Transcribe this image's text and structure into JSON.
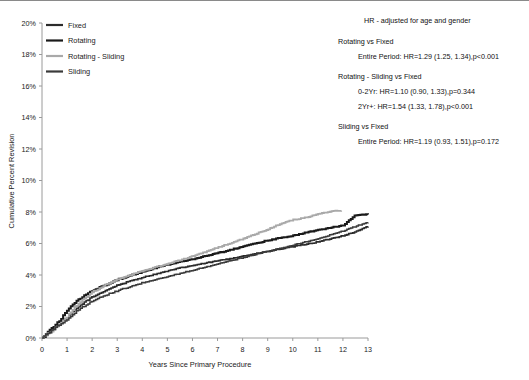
{
  "chart_data": {
    "type": "line",
    "title": "",
    "xlabel": "Years Since Primary Procedure",
    "ylabel": "Cumulative Percent Revision",
    "xlim": [
      0,
      13
    ],
    "ylim": [
      0,
      20
    ],
    "xticks": [
      "0",
      "1",
      "2",
      "3",
      "4",
      "5",
      "6",
      "7",
      "8",
      "9",
      "10",
      "11",
      "12",
      "13"
    ],
    "yticks": [
      "0%",
      "2%",
      "4%",
      "6%",
      "8%",
      "10%",
      "12%",
      "14%",
      "16%",
      "18%",
      "20%"
    ],
    "grid": false,
    "legend_position": "top-left",
    "x": [
      0,
      0.25,
      0.5,
      0.75,
      1,
      1.25,
      1.5,
      1.75,
      2,
      2.5,
      3,
      3.5,
      4,
      4.5,
      5,
      5.5,
      6,
      6.5,
      7,
      7.5,
      8,
      8.5,
      9,
      9.5,
      10,
      10.5,
      11,
      11.5,
      12,
      12.5,
      13
    ],
    "series": [
      {
        "name": "Fixed",
        "color": "#2b2b2b",
        "width": 1.6,
        "values": [
          0,
          0.35,
          0.65,
          0.95,
          1.3,
          1.7,
          2.05,
          2.35,
          2.6,
          3.0,
          3.35,
          3.6,
          3.85,
          4.05,
          4.25,
          4.45,
          4.6,
          4.75,
          4.9,
          5.05,
          5.2,
          5.35,
          5.5,
          5.65,
          5.8,
          5.95,
          6.1,
          6.3,
          6.5,
          6.75,
          7.1
        ]
      },
      {
        "name": "Rotating",
        "color": "#1a1a1a",
        "width": 2.0,
        "values": [
          0,
          0.4,
          0.8,
          1.2,
          1.75,
          2.2,
          2.5,
          2.75,
          3.0,
          3.35,
          3.7,
          3.95,
          4.2,
          4.45,
          4.65,
          4.85,
          5.0,
          5.2,
          5.4,
          5.6,
          5.8,
          6.0,
          6.2,
          6.35,
          6.5,
          6.7,
          6.85,
          7.0,
          7.15,
          7.8,
          7.85
        ]
      },
      {
        "name": "Rotating - Sliding",
        "color": "#a9a9a9",
        "width": 1.8,
        "values": [
          0,
          0.3,
          0.6,
          0.95,
          1.35,
          1.85,
          2.25,
          2.6,
          2.9,
          3.35,
          3.7,
          4.0,
          4.25,
          4.5,
          4.7,
          4.95,
          5.2,
          5.45,
          5.75,
          6.0,
          6.3,
          6.6,
          6.9,
          7.25,
          7.5,
          7.65,
          7.85,
          8.05,
          8.1,
          null,
          null
        ]
      },
      {
        "name": "Sliding",
        "color": "#3a3a3a",
        "width": 1.5,
        "values": [
          0,
          0.3,
          0.6,
          0.9,
          1.2,
          1.55,
          1.85,
          2.1,
          2.35,
          2.7,
          3.0,
          3.25,
          3.5,
          3.7,
          3.9,
          4.1,
          4.3,
          4.5,
          4.7,
          4.9,
          5.1,
          5.3,
          5.5,
          5.7,
          5.9,
          6.1,
          6.3,
          6.55,
          6.8,
          7.1,
          7.35
        ]
      }
    ]
  },
  "legend": {
    "items": [
      {
        "label": "Fixed",
        "color": "#2b2b2b"
      },
      {
        "label": "Rotating",
        "color": "#1a1a1a"
      },
      {
        "label": "Rotating - Sliding",
        "color": "#a9a9a9"
      },
      {
        "label": "Sliding",
        "color": "#3a3a3a"
      }
    ]
  },
  "annotations": {
    "heading": "HR - adjusted for age and gender",
    "groups": [
      {
        "title": "Rotating vs Fixed",
        "lines": [
          "Entire Period: HR=1.29 (1.25, 1.34),p<0.001"
        ]
      },
      {
        "title": "Rotating - Sliding vs Fixed",
        "lines": [
          "0-2Yr: HR=1.10 (0.90, 1.33),p=0.344",
          "2Yr+: HR=1.54 (1.33, 1.78),p<0.001"
        ]
      },
      {
        "title": "Sliding vs Fixed",
        "lines": [
          "Entire Period: HR=1.19 (0.93, 1.51),p=0.172"
        ]
      }
    ]
  }
}
